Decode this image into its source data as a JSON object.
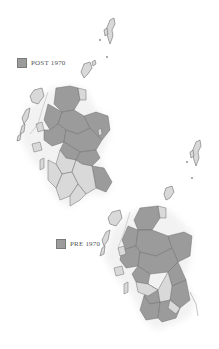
{
  "colors": {
    "post_region": "#9b9b9b",
    "pre_region": "#d9d9d9",
    "outline": "#6f6f6f",
    "swatch": "#9b9b9b",
    "glow": "#f2f2f2"
  },
  "maps": [
    {
      "id": "post-1970",
      "legend_label": "POST 1970"
    },
    {
      "id": "pre-1970",
      "legend_label": "PRE 1970"
    }
  ]
}
